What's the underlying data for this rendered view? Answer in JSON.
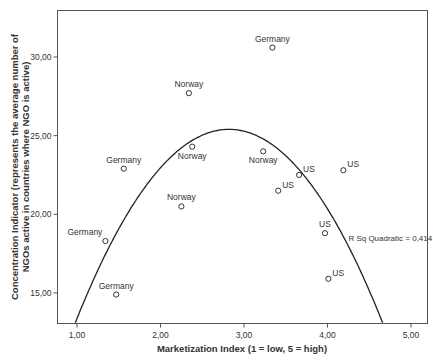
{
  "chart_data": {
    "type": "scatter",
    "title": "",
    "xlabel": "Marketization Index (1 = low, 5 = high)",
    "ylabel_line1": "Concentration Indicator (represents the average number of",
    "ylabel_line2": "NGOs active in countries where NGO is active)",
    "xlim": [
      0.78,
      5.22
    ],
    "ylim": [
      13.0,
      33.0
    ],
    "x_ticks": [
      1,
      2,
      3,
      4,
      5
    ],
    "x_tick_labels": [
      "1,00",
      "2,00",
      "3,00",
      "4,00",
      "5,00"
    ],
    "y_ticks": [
      15,
      20,
      25,
      30
    ],
    "y_tick_labels": [
      "15,00",
      "20,00",
      "25,00",
      "30,00"
    ],
    "grid": false,
    "legend": null,
    "points": [
      {
        "label": "Germany",
        "x": 3.34,
        "y": 30.6,
        "label_pos": "above"
      },
      {
        "label": "Norway",
        "x": 2.34,
        "y": 27.7,
        "label_pos": "above"
      },
      {
        "label": "Norway",
        "x": 2.38,
        "y": 24.3,
        "label_pos": "below"
      },
      {
        "label": "Norway",
        "x": 3.23,
        "y": 24.0,
        "label_pos": "below"
      },
      {
        "label": "Germany",
        "x": 1.56,
        "y": 22.9,
        "label_pos": "above"
      },
      {
        "label": "US",
        "x": 3.66,
        "y": 22.5,
        "label_pos": "right"
      },
      {
        "label": "US",
        "x": 4.19,
        "y": 22.8,
        "label_pos": "right"
      },
      {
        "label": "US",
        "x": 3.41,
        "y": 21.5,
        "label_pos": "right"
      },
      {
        "label": "Norway",
        "x": 2.25,
        "y": 20.5,
        "label_pos": "above"
      },
      {
        "label": "US",
        "x": 3.97,
        "y": 18.8,
        "label_pos": "above"
      },
      {
        "label": "Germany",
        "x": 1.34,
        "y": 18.3,
        "label_pos": "left"
      },
      {
        "label": "US",
        "x": 4.01,
        "y": 15.9,
        "label_pos": "right"
      },
      {
        "label": "Germany",
        "x": 1.47,
        "y": 14.9,
        "label_pos": "above"
      }
    ],
    "fit": {
      "type": "quadratic",
      "vertex_x": 2.82,
      "vertex_y": 25.4,
      "a": -3.63,
      "annotation": "R Sq Quadratic = 0,414",
      "annotation_x": 4.25,
      "annotation_y": 18.5
    }
  }
}
